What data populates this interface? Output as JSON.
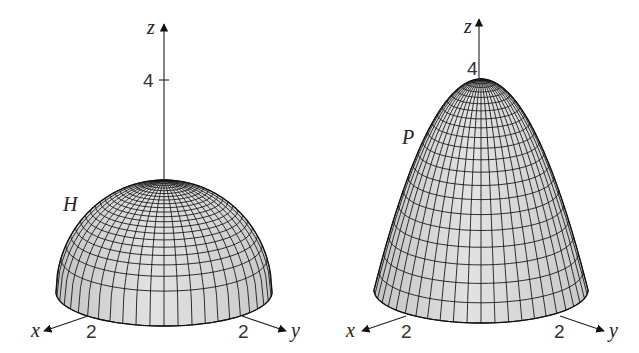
{
  "figures": [
    {
      "id": "hemisphere",
      "surface_label": "H",
      "axes": {
        "x_label": "x",
        "y_label": "y",
        "z_label": "z"
      },
      "ticks": {
        "z": "4",
        "x": "2",
        "y": "2"
      },
      "colors": {
        "surface": "#d6d6d6",
        "mesh": "#1a1a1a",
        "axis": "#222222"
      }
    },
    {
      "id": "paraboloid",
      "surface_label": "P",
      "axes": {
        "x_label": "x",
        "y_label": "y",
        "z_label": "z"
      },
      "ticks": {
        "z": "4",
        "x": "2",
        "y": "2"
      },
      "colors": {
        "surface": "#d6d6d6",
        "mesh": "#1a1a1a",
        "axis": "#222222"
      }
    }
  ]
}
